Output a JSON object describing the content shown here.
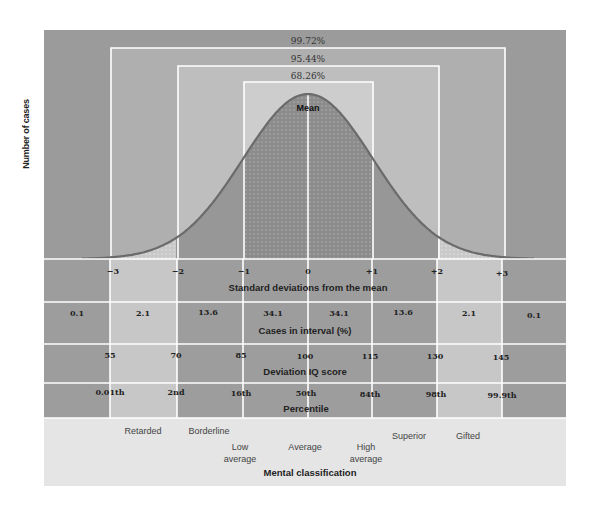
{
  "chart_data": {
    "type": "area",
    "title": "",
    "ylabel": "Number of cases",
    "xlabel": "Standard deviations from the mean",
    "curve": "normal",
    "mean_label": "Mean",
    "brackets": [
      {
        "label": "68.26%",
        "from_sd": -1,
        "to_sd": 1
      },
      {
        "label": "95.44%",
        "from_sd": -2,
        "to_sd": 2
      },
      {
        "label": "99.72%",
        "from_sd": -3,
        "to_sd": 3
      }
    ],
    "x": [
      -3,
      -2,
      -1,
      0,
      1,
      2,
      3
    ],
    "x_tick_labels": [
      "−3",
      "−2",
      "−1",
      "0",
      "+1",
      "+2",
      "+3"
    ],
    "cases_in_interval_pct": {
      "label": "Cases in interval (%)",
      "intervals": [
        "<-3",
        "-3 to -2",
        "-2 to -1",
        "-1 to 0",
        "0 to +1",
        "+1 to +2",
        "+2 to +3",
        ">+3"
      ],
      "values": [
        0.1,
        2.1,
        13.6,
        34.1,
        34.1,
        13.6,
        2.1,
        0.1
      ]
    },
    "deviation_iq_score": {
      "label": "Deviation IQ score",
      "values": [
        55,
        70,
        85,
        100,
        115,
        130,
        145
      ]
    },
    "percentile": {
      "label": "Percentile",
      "values": [
        "0.01th",
        "2nd",
        "16th",
        "50th",
        "84th",
        "98th",
        "99.9th"
      ]
    },
    "mental_classification": {
      "label": "Mental classification",
      "categories": [
        "Retarded",
        "Borderline",
        "Low average",
        "Average",
        "High average",
        "Superior",
        "Gifted"
      ]
    },
    "colors": {
      "outer_band": "#9a9a9a",
      "band_2_3": "#b4b4b4",
      "band_1_2": "#c2c2c2",
      "band_0_1": "#cfcfcf",
      "curve_fill": "#8f8f8f",
      "curve_line": "#6e6e6e",
      "table_dark": "#9c9c9c",
      "table_light": "#c6c6c6",
      "classification_bg": "#e4e4e4",
      "grid_lines": "#ffffff"
    }
  },
  "labels": {
    "y_axis": "Number of cases",
    "pct_68": "68.26%",
    "pct_95": "95.44%",
    "pct_99": "99.72%",
    "mean": "Mean",
    "sd_title": "Standard deviations from the mean",
    "cases_title": "Cases in interval (%)",
    "iq_title": "Deviation IQ score",
    "percentile_title": "Percentile",
    "class_title": "Mental classification"
  },
  "sd_ticks": [
    "−3",
    "−2",
    "−1",
    "0",
    "+1",
    "+2",
    "+3"
  ],
  "cases": [
    "0.1",
    "2.1",
    "13.6",
    "34.1",
    "34.1",
    "13.6",
    "2.1",
    "0.1"
  ],
  "iq": [
    "55",
    "70",
    "85",
    "100",
    "115",
    "130",
    "145"
  ],
  "percentiles": [
    "0.01th",
    "2nd",
    "16th",
    "50th",
    "84th",
    "98th",
    "99.9th"
  ],
  "classes": [
    "Retarded",
    "Borderline",
    "Low\naverage",
    "Average",
    "High\naverage",
    "Superior",
    "Gifted"
  ]
}
